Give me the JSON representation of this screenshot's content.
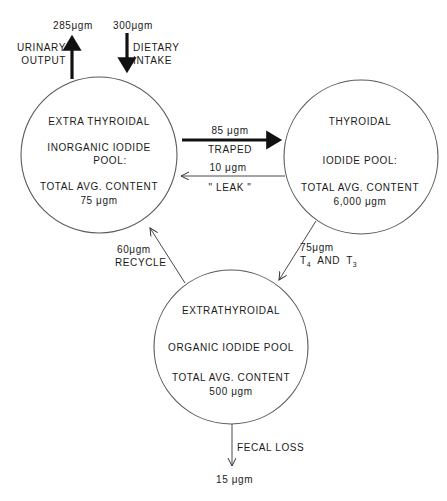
{
  "diagram": {
    "type": "iodine-metabolism-flow",
    "pools": {
      "inorganic": {
        "line1": "EXTRA THYROIDAL",
        "line2": "INORGANIC  IODIDE",
        "line3": "POOL:",
        "line4": "TOTAL  AVG.  CONTENT",
        "line5": "75  μgm"
      },
      "thyroidal": {
        "line1": "THYROIDAL",
        "line2": "IODIDE  POOL:",
        "line3": "TOTAL  AVG.  CONTENT",
        "line4": "6,000  μgm"
      },
      "organic": {
        "line1": "EXTRATHYROIDAL",
        "line2": "ORGANIC  IODIDE  POOL",
        "line3": "TOTAL  AVG.  CONTENT",
        "line4": "500  μgm"
      }
    },
    "flows": {
      "urinary": {
        "amount": "285μgm",
        "label1": "URINARY",
        "label2": "OUTPUT"
      },
      "dietary": {
        "amount": "300μgm",
        "label1": "DIETARY",
        "label2": "INTAKE"
      },
      "trapped": {
        "amount": "85 μgm",
        "label": "TRAPED"
      },
      "leak": {
        "amount": "10 μgm",
        "label": "\" LEAK \""
      },
      "hormone": {
        "amount": "75μgm",
        "label_t4": "T",
        "sub4": "4",
        "label_and": "AND",
        "label_t3": "T",
        "sub3": "3"
      },
      "recycle": {
        "amount": "60μgm",
        "label": "RECYCLE"
      },
      "fecal": {
        "amount": "15 μgm",
        "label": "FECAL  LOSS"
      }
    },
    "colors": {
      "ink": "#1a1a1a",
      "circle": "#5a5a5a",
      "background": "#ffffff"
    }
  }
}
